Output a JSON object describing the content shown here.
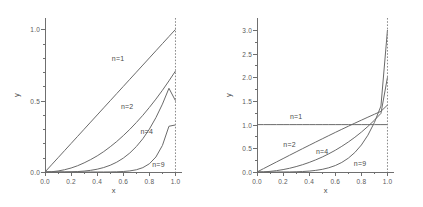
{
  "figure": {
    "panels": [
      {
        "id": "left",
        "axis": {
          "xlabel": "x",
          "ylabel": "y",
          "xlim": [
            0,
            1.05
          ],
          "ylim": [
            0,
            1.08
          ],
          "xticks": [
            0.0,
            0.2,
            0.4,
            0.6,
            0.8,
            1.0
          ],
          "xticklabels": [
            "0.0",
            "0.2",
            "0.4",
            "0.6",
            "0.8",
            "1.0"
          ],
          "yticks": [
            0.0,
            0.5,
            1.0
          ],
          "yticklabels": [
            "0.0",
            "0.5",
            "1.0"
          ],
          "xminor": [
            0.1,
            0.3,
            0.5,
            0.7,
            0.9
          ],
          "yminor": [
            0.1,
            0.2,
            0.3,
            0.4,
            0.6,
            0.7,
            0.8,
            0.9
          ]
        },
        "reference_line": {
          "x": 1.0,
          "style": "dashed"
        },
        "curve_labels": [
          {
            "text": "n=1",
            "x": 0.56,
            "y": 0.8
          },
          {
            "text": "n=2",
            "x": 0.63,
            "y": 0.46
          },
          {
            "text": "n=4",
            "x": 0.78,
            "y": 0.29
          },
          {
            "text": "n=9",
            "x": 0.87,
            "y": 0.055
          }
        ]
      },
      {
        "id": "right",
        "axis": {
          "xlabel": "x",
          "ylabel": "y",
          "xlim": [
            0,
            1.05
          ],
          "ylim": [
            0,
            3.25
          ],
          "xticks": [
            0.0,
            0.2,
            0.4,
            0.6,
            0.8,
            1.0
          ],
          "xticklabels": [
            "0.0",
            "0.2",
            "0.4",
            "0.6",
            "0.8",
            "1.0"
          ],
          "yticks": [
            0.0,
            0.5,
            1.0,
            1.5,
            2.0,
            2.5,
            3.0
          ],
          "yticklabels": [
            "0.0",
            "0.5",
            "1.0",
            "1.5",
            "2.0",
            "2.5",
            "3.0"
          ],
          "xminor": [
            0.1,
            0.3,
            0.5,
            0.7,
            0.9
          ],
          "yminor": [
            0.25,
            0.75,
            1.25,
            1.75,
            2.25,
            2.75
          ]
        },
        "reference_line": {
          "x": 1.0,
          "style": "dashed"
        },
        "curve_labels": [
          {
            "text": "n=1",
            "x": 0.3,
            "y": 1.18
          },
          {
            "text": "n=2",
            "x": 0.25,
            "y": 0.6
          },
          {
            "text": "n=4",
            "x": 0.5,
            "y": 0.44
          },
          {
            "text": "n=9",
            "x": 0.79,
            "y": 0.2
          }
        ]
      }
    ]
  },
  "chart_data": [
    {
      "type": "line",
      "title": "",
      "panel": "left",
      "xlabel": "x",
      "ylabel": "y",
      "xlim": [
        0,
        1.05
      ],
      "ylim": [
        0,
        1.08
      ],
      "grid": false,
      "legend": "inline-curve-labels",
      "x": [
        0.0,
        0.05,
        0.1,
        0.15,
        0.2,
        0.25,
        0.3,
        0.35,
        0.4,
        0.45,
        0.5,
        0.55,
        0.6,
        0.65,
        0.7,
        0.75,
        0.8,
        0.85,
        0.9,
        0.95,
        1.0
      ],
      "series": [
        {
          "name": "n=1",
          "values": [
            0.0,
            0.05,
            0.1,
            0.15,
            0.2,
            0.25,
            0.3,
            0.35,
            0.4,
            0.45,
            0.5,
            0.55,
            0.6,
            0.65,
            0.7,
            0.75,
            0.8,
            0.85,
            0.9,
            0.95,
            1.0
          ]
        },
        {
          "name": "n=2",
          "values": [
            0.0,
            0.0018,
            0.0071,
            0.016,
            0.028,
            0.044,
            0.064,
            0.087,
            0.113,
            0.143,
            0.177,
            0.214,
            0.255,
            0.299,
            0.347,
            0.398,
            0.453,
            0.511,
            0.573,
            0.639,
            0.708
          ]
        },
        {
          "name": "n=4",
          "values": [
            0.0,
            0.0,
            0.0001,
            0.0004,
            0.0013,
            0.0031,
            0.0064,
            0.0117,
            0.0197,
            0.0313,
            0.0474,
            0.069,
            0.0972,
            0.1332,
            0.1782,
            0.2336,
            0.3007,
            0.381,
            0.476,
            0.5871,
            0.5
          ]
        },
        {
          "name": "n=9",
          "values": [
            0.0,
            0.0,
            0.0,
            0.0,
            0.0,
            0.0,
            0.0,
            0.0,
            0.0001,
            0.0002,
            0.0006,
            0.0015,
            0.0035,
            0.0076,
            0.0156,
            0.0306,
            0.0577,
            0.1052,
            0.1862,
            0.3208,
            0.33
          ]
        }
      ]
    },
    {
      "type": "line",
      "title": "",
      "panel": "right",
      "xlabel": "x",
      "ylabel": "y",
      "xlim": [
        0,
        1.05
      ],
      "ylim": [
        0,
        3.25
      ],
      "grid": false,
      "legend": "inline-curve-labels",
      "x": [
        0.0,
        0.05,
        0.1,
        0.15,
        0.2,
        0.25,
        0.3,
        0.35,
        0.4,
        0.45,
        0.5,
        0.55,
        0.6,
        0.65,
        0.7,
        0.75,
        0.8,
        0.85,
        0.9,
        0.95,
        1.0
      ],
      "series": [
        {
          "name": "n=1",
          "values": [
            1.0,
            1.0,
            1.0,
            1.0,
            1.0,
            1.0,
            1.0,
            1.0,
            1.0,
            1.0,
            1.0,
            1.0,
            1.0,
            1.0,
            1.0,
            1.0,
            1.0,
            1.0,
            1.0,
            1.0,
            1.0
          ]
        },
        {
          "name": "n=2",
          "values": [
            0.0,
            0.071,
            0.142,
            0.213,
            0.283,
            0.354,
            0.424,
            0.494,
            0.563,
            0.632,
            0.7,
            0.768,
            0.835,
            0.901,
            0.966,
            1.031,
            1.094,
            1.157,
            1.219,
            1.28,
            1.414
          ]
        },
        {
          "name": "n=4",
          "values": [
            0.0,
            0.003,
            0.013,
            0.029,
            0.051,
            0.079,
            0.114,
            0.155,
            0.202,
            0.256,
            0.316,
            0.384,
            0.459,
            0.542,
            0.633,
            0.733,
            0.842,
            0.962,
            1.093,
            1.237,
            2.0
          ]
        },
        {
          "name": "n=9",
          "values": [
            0.0,
            0.0,
            0.0,
            0.0,
            0.001,
            0.002,
            0.005,
            0.01,
            0.019,
            0.034,
            0.056,
            0.089,
            0.136,
            0.202,
            0.292,
            0.412,
            0.57,
            0.777,
            1.046,
            1.392,
            3.0
          ]
        }
      ]
    }
  ]
}
